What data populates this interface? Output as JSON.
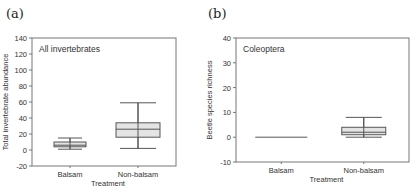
{
  "panels": [
    {
      "label": "(a)"
    },
    {
      "label": "(b)"
    }
  ],
  "chart_data": [
    {
      "type": "box",
      "panel": "(a)",
      "title": "All invertebrates",
      "xlabel": "Treatment",
      "ylabel": "Total invertebrate abundance",
      "categories": [
        "Balsam",
        "Non-balsam"
      ],
      "ylim": [
        -20,
        140
      ],
      "yticks": [
        -20,
        0,
        20,
        40,
        60,
        80,
        100,
        120,
        140
      ],
      "boxes": [
        {
          "category": "Balsam",
          "whisker_low": 1,
          "q1": 4,
          "median": 6,
          "q3": 10,
          "whisker_high": 15
        },
        {
          "category": "Non-balsam",
          "whisker_low": 2,
          "q1": 16,
          "median": 26,
          "q3": 34,
          "whisker_high": 59
        }
      ],
      "grid": false
    },
    {
      "type": "box",
      "panel": "(b)",
      "title": "Coleoptera",
      "xlabel": "Treatment",
      "ylabel": "Beetle species richness",
      "categories": [
        "Balsam",
        "Non-balsam"
      ],
      "ylim": [
        -10,
        40
      ],
      "yticks": [
        -10,
        0,
        10,
        20,
        30,
        40
      ],
      "boxes": [
        {
          "category": "Balsam",
          "whisker_low": 0,
          "q1": 0,
          "median": 0,
          "q3": 0,
          "whisker_high": 0
        },
        {
          "category": "Non-balsam",
          "whisker_low": 0,
          "q1": 1,
          "median": 2,
          "q3": 4,
          "whisker_high": 8
        }
      ],
      "grid": false
    }
  ]
}
